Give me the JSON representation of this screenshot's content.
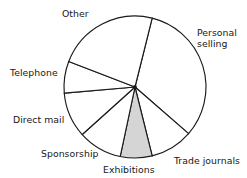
{
  "chart_data": {
    "type": "pie",
    "title": "",
    "subtitle": "",
    "xlabel": "",
    "ylabel": "",
    "legend_position": "none",
    "grid": false,
    "labels_placement": "outside-around-circle",
    "start_angle_deg": 14,
    "direction": "clockwise",
    "categories": [
      "Personal selling",
      "Trade journals",
      "Exhibitions",
      "Sponsorship",
      "Direct mail",
      "Telephone",
      "Other"
    ],
    "values": [
      32.5,
      9.7,
      7.2,
      10.0,
      10.3,
      7.2,
      23.1
    ],
    "units": "percent",
    "angles_deg": [
      117,
      35,
      26,
      36,
      37,
      26,
      83
    ],
    "slices": [
      {
        "label": "Personal selling",
        "value": 32.5,
        "angle_deg": 117,
        "start_deg": 14,
        "end_deg": 131,
        "fill": "#ffffff",
        "highlighted": false
      },
      {
        "label": "Trade journals",
        "value": 9.7,
        "angle_deg": 35,
        "start_deg": 131,
        "end_deg": 166,
        "fill": "#ffffff",
        "highlighted": false
      },
      {
        "label": "Exhibitions",
        "value": 7.2,
        "angle_deg": 26,
        "start_deg": 166,
        "end_deg": 192,
        "fill": "#d5d5d5",
        "highlighted": true
      },
      {
        "label": "Sponsorship",
        "value": 10.0,
        "angle_deg": 36,
        "start_deg": 192,
        "end_deg": 228,
        "fill": "#ffffff",
        "highlighted": false
      },
      {
        "label": "Direct mail",
        "value": 10.3,
        "angle_deg": 37,
        "start_deg": 228,
        "end_deg": 265,
        "fill": "#ffffff",
        "highlighted": false
      },
      {
        "label": "Telephone",
        "value": 7.2,
        "angle_deg": 26,
        "start_deg": 265,
        "end_deg": 291,
        "fill": "#ffffff",
        "highlighted": false
      },
      {
        "label": "Other",
        "value": 23.1,
        "angle_deg": 83,
        "start_deg": 291,
        "end_deg": 374,
        "fill": "#ffffff",
        "highlighted": false
      }
    ]
  },
  "labels": {
    "other": "Other",
    "personal_selling_line1": "Personal",
    "personal_selling_line2": "selling",
    "trade_journals": "Trade journals",
    "exhibitions": "Exhibitions",
    "sponsorship": "Sponsorship",
    "direct_mail": "Direct mail",
    "telephone": "Telephone"
  },
  "colors": {
    "outline": "#1a1a1a",
    "slice_fill": "#ffffff",
    "highlight_fill": "#d5d5d5",
    "text": "#171717",
    "background": "#ffffff"
  }
}
